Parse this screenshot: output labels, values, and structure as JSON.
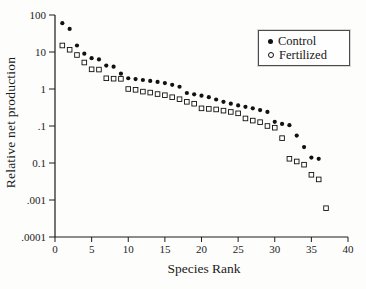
{
  "figure": {
    "background": "#fdfdfc",
    "ink_color": "#1c1c1c"
  },
  "chart_data": {
    "type": "scatter",
    "title": "",
    "xlabel": "Species Rank",
    "ylabel": "Relative net production",
    "grid": false,
    "xlim": [
      0,
      40
    ],
    "x_ticks": [
      0,
      5,
      10,
      15,
      20,
      25,
      30,
      35,
      40
    ],
    "y_scale": "log",
    "ylim": [
      0.0001,
      100
    ],
    "y_tick_labels": [
      "100",
      "10",
      "1",
      ".1",
      "0.1",
      ".001",
      ".0001"
    ],
    "y_tick_values": [
      100,
      10,
      1,
      0.1,
      0.01,
      0.001,
      0.0001
    ],
    "legend": {
      "position": "top-right",
      "entries": [
        {
          "label": "Control",
          "marker": "filled-circle"
        },
        {
          "label": "Fertilized",
          "marker": "open-square"
        }
      ]
    },
    "series": [
      {
        "name": "Control",
        "marker": "filled-circle",
        "color": "#111111",
        "x": [
          1,
          2,
          3,
          4,
          5,
          6,
          7,
          8,
          9,
          10,
          11,
          12,
          13,
          14,
          15,
          16,
          17,
          18,
          19,
          20,
          21,
          22,
          23,
          24,
          25,
          26,
          27,
          28,
          29,
          30,
          31,
          32,
          33,
          34,
          35,
          36
        ],
        "values": [
          60,
          42,
          15,
          9,
          6.8,
          6.3,
          4.3,
          4.0,
          2.6,
          1.95,
          1.85,
          1.75,
          1.65,
          1.55,
          1.45,
          1.3,
          1.15,
          0.78,
          0.72,
          0.66,
          0.6,
          0.52,
          0.45,
          0.4,
          0.36,
          0.33,
          0.3,
          0.27,
          0.24,
          0.13,
          0.114,
          0.105,
          0.055,
          0.027,
          0.014,
          0.013
        ]
      },
      {
        "name": "Fertilized",
        "marker": "open-square",
        "color": "#111111",
        "x": [
          1,
          2,
          3,
          4,
          5,
          6,
          7,
          8,
          9,
          10,
          11,
          12,
          13,
          14,
          15,
          16,
          17,
          18,
          19,
          20,
          21,
          22,
          23,
          24,
          25,
          26,
          27,
          28,
          29,
          30,
          31,
          32,
          33,
          34,
          35,
          36,
          37
        ],
        "values": [
          15,
          11.5,
          8.3,
          5.2,
          3.4,
          3.35,
          1.95,
          1.9,
          1.88,
          1.0,
          0.95,
          0.85,
          0.8,
          0.73,
          0.68,
          0.6,
          0.53,
          0.45,
          0.4,
          0.3,
          0.29,
          0.28,
          0.26,
          0.24,
          0.22,
          0.16,
          0.14,
          0.127,
          0.1,
          0.09,
          0.047,
          0.013,
          0.011,
          0.009,
          0.0048,
          0.0036,
          0.0006
        ]
      }
    ]
  }
}
